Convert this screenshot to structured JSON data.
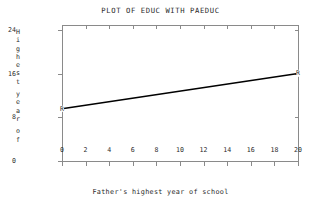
{
  "chart_data": {
    "type": "line",
    "title": "PLOT OF EDUC WITH PAEDUC",
    "xlabel": "Father's highest year of school",
    "ylabel": "Highest year of",
    "xlim": [
      0,
      20
    ],
    "ylim": [
      0,
      25
    ],
    "grid": false,
    "legend": null,
    "xticks": [
      0,
      2,
      4,
      6,
      8,
      10,
      12,
      14,
      16,
      18,
      20
    ],
    "xtick_labels": [
      "0",
      "2",
      "4",
      "6",
      "8",
      "10",
      "12",
      "14",
      "16",
      "18",
      "20"
    ],
    "yticks": [
      0,
      8,
      16,
      24
    ],
    "ytick_labels": [
      "0",
      "8",
      "16",
      "24"
    ],
    "series": [
      {
        "name": "Regression line EDUC on PAEDUC",
        "x": [
          0,
          20
        ],
        "values": [
          9.6,
          16.1
        ],
        "marker_labels": [
          "R",
          "R"
        ]
      }
    ],
    "annotations": [
      {
        "text": "R",
        "x": 0,
        "y": 9.6
      },
      {
        "text": "R",
        "x": 20,
        "y": 16.1
      }
    ]
  },
  "ylabel_chars": [
    "H",
    "i",
    "g",
    "h",
    "e",
    "s",
    "t",
    "",
    "y",
    "e",
    "a",
    "r",
    "",
    "o",
    "f"
  ]
}
